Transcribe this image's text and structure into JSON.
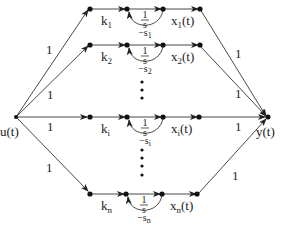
{
  "diagram": {
    "type": "signal-flow-graph",
    "input_label": "u(t)",
    "output_label": "y(t)",
    "rows": [
      {
        "id": "1",
        "gain_label": "k",
        "gain_sub": "1",
        "integrator_label": "1/s",
        "int_num": "1",
        "int_den": "s",
        "feedback_label": "−s",
        "feedback_sub": "1",
        "state_label": "x",
        "state_sub": "1",
        "state_suffix": "(t)",
        "in_weight": "1",
        "out_weight": "1"
      },
      {
        "id": "2",
        "gain_label": "k",
        "gain_sub": "2",
        "integrator_label": "1/s",
        "int_num": "1",
        "int_den": "s",
        "feedback_label": "−s",
        "feedback_sub": "2",
        "state_label": "x",
        "state_sub": "2",
        "state_suffix": "(t)",
        "in_weight": "1",
        "out_weight": "1"
      },
      {
        "id": "i",
        "gain_label": "k",
        "gain_sub": "i",
        "integrator_label": "1/s",
        "int_num": "1",
        "int_den": "s",
        "feedback_label": "−s",
        "feedback_sub": "i",
        "state_label": "x",
        "state_sub": "i",
        "state_suffix": "(t)",
        "in_weight": "1",
        "out_weight": "1"
      },
      {
        "id": "n",
        "gain_label": "k",
        "gain_sub": "n",
        "integrator_label": "1/s",
        "int_num": "1",
        "int_den": "s",
        "feedback_label": "−s",
        "feedback_sub": "n",
        "state_label": "x",
        "state_sub": "n",
        "state_suffix": "(t)",
        "in_weight": "1",
        "out_weight": "1"
      }
    ],
    "ellipsis": "⋮",
    "colors": {
      "line": "#333333",
      "node": "#111111",
      "text": "#222222"
    }
  }
}
